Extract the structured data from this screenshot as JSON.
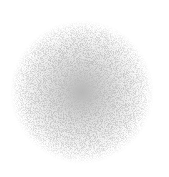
{
  "image": {
    "subject": "stippled noise sphere",
    "background_color": "#ffffff",
    "core_color": "#6e6e6e",
    "mid_color": "#9a9a9a",
    "edge_color": "#d0d0d0",
    "center": [
      82,
      92
    ],
    "radius": 70
  }
}
